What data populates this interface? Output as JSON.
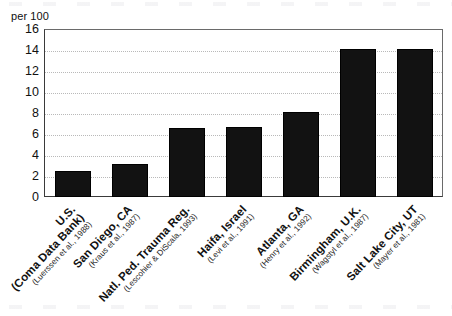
{
  "chart_data": {
    "type": "bar",
    "title": "",
    "xlabel": "",
    "ylabel": "per 100",
    "ylim": [
      0,
      16
    ],
    "ytick_step": 2,
    "yticks": [
      16,
      14,
      12,
      10,
      8,
      6,
      4,
      2,
      0
    ],
    "grid": true,
    "legend": "none",
    "bar_color": "#121212",
    "categories": [
      "U.S.\n(Coma Data Bank)",
      "San Diego, CA",
      "Natl. Ped. Trauma Reg.",
      "Haifa, Israel",
      "Atlanta, GA",
      "Birmingham, U.K.",
      "Salt Lake City, UT"
    ],
    "values": [
      2.5,
      3.1,
      6.6,
      6.7,
      8.1,
      14.1,
      14.1
    ]
  },
  "axis": {
    "unit_label": "per 100",
    "ytick_labels": [
      "16",
      "14",
      "12",
      "10",
      "8",
      "6",
      "4",
      "2",
      "0"
    ]
  },
  "bars": [
    {
      "place": "U.S.",
      "place_line2": "(Coma Data Bank)",
      "citation": "(Luerssen et al., 1988)",
      "value": 2.5
    },
    {
      "place": "San Diego, CA",
      "place_line2": "",
      "citation": "(Kraus et al., 1987)",
      "value": 3.1
    },
    {
      "place": "Natl. Ped. Trauma Reg.",
      "place_line2": "",
      "citation": "(Lescohier & DiScala, 1993)",
      "value": 6.6
    },
    {
      "place": "Haifa, Israel",
      "place_line2": "",
      "citation": "(Levi et al., 1991)",
      "value": 6.7
    },
    {
      "place": "Atlanta, GA",
      "place_line2": "",
      "citation": "(Henry et al., 1992)",
      "value": 8.1
    },
    {
      "place": "Birmingham, U.K.",
      "place_line2": "",
      "citation": "(Wagstyl et al., 1987)",
      "value": 14.1
    },
    {
      "place": "Salt Lake City, UT",
      "place_line2": "",
      "citation": "(Mayer et al., 1981)",
      "value": 14.1
    }
  ]
}
